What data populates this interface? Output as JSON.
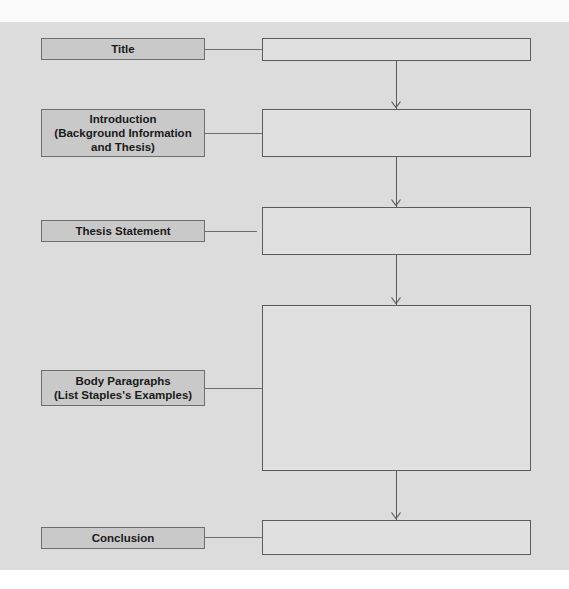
{
  "diagram": {
    "type": "essay-outline-flowchart",
    "rows": [
      {
        "label": "Title",
        "content": ""
      },
      {
        "label": "Introduction\n(Background Information\nand Thesis)",
        "content": ""
      },
      {
        "label": "Thesis Statement",
        "content": ""
      },
      {
        "label": "Body Paragraphs\n(List Staples's Examples)",
        "content": ""
      },
      {
        "label": "Conclusion",
        "content": ""
      }
    ],
    "colors": {
      "panel": "#dcdcdc",
      "label_box": "#c9c9c9",
      "border": "#5c5c5c"
    }
  }
}
